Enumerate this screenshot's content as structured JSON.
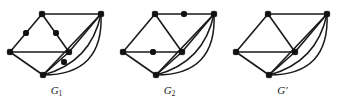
{
  "figure": {
    "kind": "graph-diagram-triple",
    "background": "#ffffff",
    "ink": "#1a1a1a",
    "node_color": "#111111",
    "panels": [
      {
        "id": "G1",
        "caption_base": "G",
        "caption_sub": "1",
        "caption_prime": "",
        "origin_x": 0,
        "vertices": [
          {
            "name": "top-left",
            "x": 42,
            "y": 14
          },
          {
            "name": "top-right",
            "x": 101,
            "y": 14
          },
          {
            "name": "left",
            "x": 10,
            "y": 52
          },
          {
            "name": "center",
            "x": 69,
            "y": 52
          },
          {
            "name": "bottom",
            "x": 43,
            "y": 75
          }
        ],
        "straight_edges": [
          {
            "from": "top-left",
            "to": "top-right"
          },
          {
            "from": "top-left",
            "to": "left"
          },
          {
            "from": "top-left",
            "to": "center"
          },
          {
            "from": "left",
            "to": "center"
          },
          {
            "from": "left",
            "to": "bottom"
          },
          {
            "from": "center",
            "to": "bottom"
          },
          {
            "from": "top-right",
            "to": "center"
          },
          {
            "from": "top-right",
            "to": "bottom"
          }
        ],
        "arcs": [
          {
            "from": "top-right",
            "to": "bottom",
            "bulge": 26
          },
          {
            "from": "top-right",
            "to": "bottom",
            "bulge": 44
          }
        ],
        "subdivision_dots": [
          {
            "on_edge": "top-left__left",
            "x": 26,
            "y": 33
          },
          {
            "on_edge": "top-left__center",
            "x": 56,
            "y": 33
          },
          {
            "on_edge": "top-right__bottom",
            "x": 64,
            "y": 62
          }
        ]
      },
      {
        "id": "G2",
        "caption_base": "G",
        "caption_sub": "2",
        "caption_prime": "",
        "origin_x": 113,
        "vertices": [
          {
            "name": "top-left",
            "x": 42,
            "y": 14
          },
          {
            "name": "top-right",
            "x": 101,
            "y": 14
          },
          {
            "name": "left",
            "x": 10,
            "y": 52
          },
          {
            "name": "center",
            "x": 69,
            "y": 52
          },
          {
            "name": "bottom",
            "x": 43,
            "y": 75
          }
        ],
        "straight_edges": [
          {
            "from": "top-left",
            "to": "top-right"
          },
          {
            "from": "top-left",
            "to": "left"
          },
          {
            "from": "top-left",
            "to": "center"
          },
          {
            "from": "left",
            "to": "center"
          },
          {
            "from": "left",
            "to": "bottom"
          },
          {
            "from": "center",
            "to": "bottom"
          },
          {
            "from": "top-right",
            "to": "center"
          },
          {
            "from": "top-right",
            "to": "bottom"
          }
        ],
        "arcs": [
          {
            "from": "top-right",
            "to": "bottom",
            "bulge": 26
          },
          {
            "from": "top-right",
            "to": "bottom",
            "bulge": 44
          }
        ],
        "subdivision_dots": [
          {
            "on_edge": "top-left__top-right",
            "x": 71,
            "y": 14
          },
          {
            "on_edge": "left__center",
            "x": 40,
            "y": 52
          }
        ]
      },
      {
        "id": "Gprime",
        "caption_base": "G",
        "caption_sub": "",
        "caption_prime": "′",
        "origin_x": 226,
        "vertices": [
          {
            "name": "top-left",
            "x": 42,
            "y": 14
          },
          {
            "name": "top-right",
            "x": 101,
            "y": 14
          },
          {
            "name": "left",
            "x": 10,
            "y": 52
          },
          {
            "name": "center",
            "x": 69,
            "y": 52
          },
          {
            "name": "bottom",
            "x": 43,
            "y": 75
          }
        ],
        "straight_edges": [
          {
            "from": "top-left",
            "to": "top-right"
          },
          {
            "from": "top-left",
            "to": "left"
          },
          {
            "from": "top-left",
            "to": "center"
          },
          {
            "from": "left",
            "to": "center"
          },
          {
            "from": "left",
            "to": "bottom"
          },
          {
            "from": "center",
            "to": "bottom"
          },
          {
            "from": "top-right",
            "to": "center"
          },
          {
            "from": "top-right",
            "to": "bottom"
          }
        ],
        "arcs": [
          {
            "from": "top-right",
            "to": "bottom",
            "bulge": 26
          },
          {
            "from": "top-right",
            "to": "bottom",
            "bulge": 44
          }
        ],
        "subdivision_dots": []
      }
    ]
  }
}
